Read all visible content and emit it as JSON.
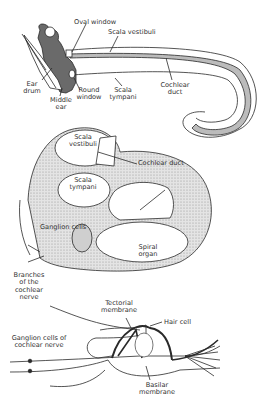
{
  "figure": {
    "panels": [
      {
        "id": "uncoiled-cochlea",
        "labels": {
          "oval_window": "Oval window",
          "scala_vestibuli": "Scala vestibuli",
          "ear_drum": "Ear drum",
          "middle_ear": "Middle ear",
          "round_window": "Round window",
          "scala_tympani": "Scala tympani",
          "cochlear_duct": "Cochlear duct"
        }
      },
      {
        "id": "cochlea-cross-section",
        "labels": {
          "scala_vestibuli": "Scala vestibuli",
          "cochlear_duct": "Cochlear duct",
          "scala_tympani": "Scala tympani",
          "ganglion_cells": "Ganglion cells",
          "spiral_organ": "Spiral organ",
          "branches_nerve": "Branches of the cochlear nerve"
        }
      },
      {
        "id": "organ-of-corti",
        "labels": {
          "tectorial_membrane": "Tectorial membrane",
          "hair_cell": "Hair cell",
          "ganglion_cells_nerve": "Ganglion cells of cochlear nerve",
          "basilar_membrane": "Basilar membrane"
        }
      }
    ],
    "colors": {
      "ink": "#2a2a2a",
      "shade": "#6a6a6a",
      "stipple": "#cfcfcf",
      "background": "#ffffff"
    }
  }
}
